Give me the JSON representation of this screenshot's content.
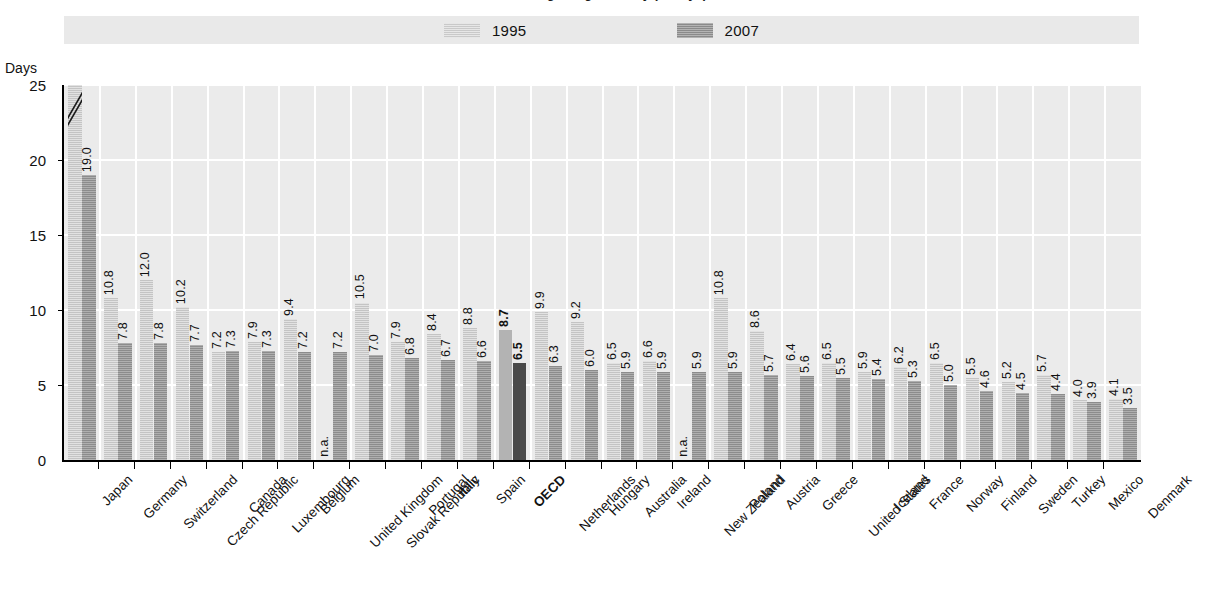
{
  "title": "Average length of stay (in days)",
  "legend": {
    "items": [
      {
        "label": "1995",
        "color": "#c4c4c4",
        "swatch": "legend-swatch-1995"
      },
      {
        "label": "2007",
        "color": "#8c8c8c",
        "swatch": "legend-swatch-2007"
      }
    ]
  },
  "yaxis": {
    "label": "Days",
    "ticks": [
      "0",
      "5",
      "10",
      "15",
      "20",
      "25"
    ],
    "min": 0,
    "max": 25
  },
  "colors": {
    "series_1995": "#c4c4c4",
    "series_2007": "#8c8c8c",
    "oecd_1995": "#b3b3b3",
    "oecd_2007": "#4a4a4a",
    "plot_background": "#ebebeb",
    "gridline": "#ffffff",
    "legend_background": "#e9e9e9",
    "axis": "#000000"
  },
  "chart_data": {
    "type": "bar",
    "title": "Average length of stay (in days)",
    "xlabel": "",
    "ylabel": "Days",
    "ylim": [
      0,
      25
    ],
    "grid": true,
    "legend_position": "top",
    "categories": [
      "Japan",
      "Germany",
      "Switzerland",
      "Czech Republic",
      "Canada",
      "Luxembourg",
      "Belgium",
      "United Kingdom",
      "Slovak Republic",
      "Portugal",
      "Italy",
      "Spain",
      "OECD",
      "Netherlands",
      "Hungary",
      "Australia",
      "Ireland",
      "New Zealand",
      "Poland",
      "Austria",
      "Greece",
      "United States",
      "Iceland",
      "France",
      "Norway",
      "Finland",
      "Sweden",
      "Turkey",
      "Mexico",
      "Denmark"
    ],
    "highlight_category": "OECD",
    "axis_break_note": "Japan 1995 bar (33.2) is truncated; axis break slashes drawn at top of bar",
    "series": [
      {
        "name": "1995",
        "values": [
          33.2,
          10.8,
          12.0,
          10.2,
          7.2,
          7.9,
          9.4,
          null,
          10.5,
          7.9,
          8.4,
          8.8,
          8.7,
          9.9,
          9.2,
          6.5,
          6.6,
          null,
          10.8,
          8.6,
          6.4,
          6.5,
          5.9,
          6.2,
          6.5,
          5.5,
          5.2,
          5.7,
          4.0,
          4.1
        ],
        "labels": [
          "33.2",
          "10.8",
          "12.0",
          "10.2",
          "7.2",
          "7.9",
          "9.4",
          "n.a.",
          "10.5",
          "7.9",
          "8.4",
          "8.8",
          "8.7",
          "9.9",
          "9.2",
          "6.5",
          "6.6",
          "n.a.",
          "10.8",
          "8.6",
          "6.4",
          "6.5",
          "5.9",
          "6.2",
          "6.5",
          "5.5",
          "5.2",
          "5.7",
          "4.0",
          "4.1"
        ]
      },
      {
        "name": "2007",
        "values": [
          19.0,
          7.8,
          7.8,
          7.7,
          7.3,
          7.3,
          7.2,
          7.2,
          7.0,
          6.8,
          6.7,
          6.6,
          6.5,
          6.3,
          6.0,
          5.9,
          5.9,
          5.9,
          5.9,
          5.7,
          5.6,
          5.5,
          5.4,
          5.3,
          5.0,
          4.6,
          4.5,
          4.4,
          3.9,
          3.5
        ],
        "labels": [
          "19.0",
          "7.8",
          "7.8",
          "7.7",
          "7.3",
          "7.3",
          "7.2",
          "7.2",
          "7.0",
          "6.8",
          "6.7",
          "6.6",
          "6.5",
          "6.3",
          "6.0",
          "5.9",
          "5.9",
          "5.9",
          "5.9",
          "5.7",
          "5.6",
          "5.5",
          "5.4",
          "5.3",
          "5.0",
          "4.6",
          "4.5",
          "4.4",
          "3.9",
          "3.5"
        ]
      }
    ]
  }
}
